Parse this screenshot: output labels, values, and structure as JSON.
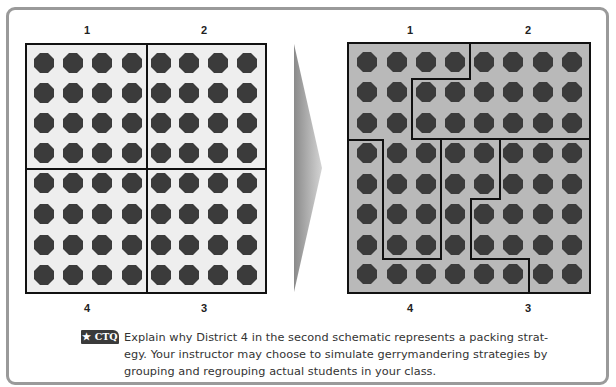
{
  "figure": {
    "left_schematic": {
      "name": "Original districts",
      "top_labels": [
        "1",
        "2"
      ],
      "bottom_labels": [
        "4",
        "3"
      ],
      "rows": 8,
      "cols": 8,
      "background": "#eeeeee",
      "districts_by_cell": [
        [
          1,
          1,
          1,
          1,
          2,
          2,
          2,
          2
        ],
        [
          1,
          1,
          1,
          1,
          2,
          2,
          2,
          2
        ],
        [
          1,
          1,
          1,
          1,
          2,
          2,
          2,
          2
        ],
        [
          1,
          1,
          1,
          1,
          2,
          2,
          2,
          2
        ],
        [
          4,
          4,
          4,
          4,
          3,
          3,
          3,
          3
        ],
        [
          4,
          4,
          4,
          4,
          3,
          3,
          3,
          3
        ],
        [
          4,
          4,
          4,
          4,
          3,
          3,
          3,
          3
        ],
        [
          4,
          4,
          4,
          4,
          3,
          3,
          3,
          3
        ]
      ]
    },
    "right_schematic": {
      "name": "Gerrymandered districts",
      "top_labels": [
        "1",
        "2"
      ],
      "bottom_labels": [
        "4",
        "3"
      ],
      "rows": 8,
      "cols": 8,
      "background": "#b9b9b9",
      "districts_by_cell": [
        [
          1,
          1,
          1,
          1,
          2,
          2,
          2,
          2
        ],
        [
          1,
          1,
          2,
          2,
          2,
          2,
          2,
          2
        ],
        [
          1,
          1,
          2,
          2,
          2,
          2,
          2,
          2
        ],
        [
          4,
          1,
          1,
          4,
          4,
          3,
          3,
          3
        ],
        [
          4,
          1,
          1,
          4,
          4,
          3,
          3,
          3
        ],
        [
          4,
          1,
          1,
          4,
          3,
          3,
          3,
          3
        ],
        [
          4,
          1,
          1,
          4,
          3,
          3,
          3,
          3
        ],
        [
          4,
          4,
          4,
          4,
          4,
          4,
          3,
          3
        ]
      ]
    },
    "arrow": "right-arrow",
    "dot_color": "#3b3b3b"
  },
  "caption": {
    "badge": "★ CTQ",
    "lines": [
      "Explain why District 4 in the second schematic represents a packing strat-",
      "egy. Your instructor may choose to simulate gerrymandering strategies by",
      "grouping and regrouping actual students in your class."
    ]
  }
}
